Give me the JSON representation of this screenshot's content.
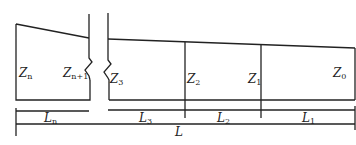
{
  "diagram": {
    "type": "channel-segment-profile",
    "line_color": "#222222",
    "section_labels": [
      {
        "base": "Z",
        "sub": "n"
      },
      {
        "base": "Z",
        "sub": "n+1"
      },
      {
        "base": "Z",
        "sub": "3"
      },
      {
        "base": "Z",
        "sub": "2"
      },
      {
        "base": "Z",
        "sub": "1"
      },
      {
        "base": "Z",
        "sub": "0"
      }
    ],
    "segment_labels": [
      {
        "base": "L",
        "sub": "n"
      },
      {
        "base": "L",
        "sub": "3"
      },
      {
        "base": "L",
        "sub": "2"
      },
      {
        "base": "L",
        "sub": "1"
      }
    ],
    "total_label": {
      "base": "L",
      "sub": ""
    }
  }
}
